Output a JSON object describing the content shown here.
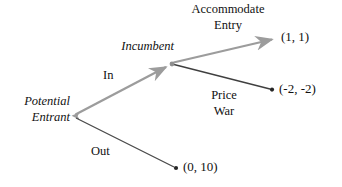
{
  "diagram": {
    "type": "extensive-form-game-tree",
    "colors": {
      "gray_path": "#9c9c9c",
      "dark_path": "#4a4a4a",
      "text": "#111111",
      "background": "#ffffff"
    },
    "nodes": [
      {
        "id": "potential-entrant",
        "label_line1": "Potential",
        "label_line2": "Entrant",
        "style": "italic",
        "x": 72,
        "y": 116
      },
      {
        "id": "incumbent",
        "label_line1": "Incumbent",
        "style": "italic",
        "x": 172,
        "y": 64
      }
    ],
    "edges": [
      {
        "id": "edge-in",
        "label": "In",
        "from": "potential-entrant",
        "to": "incumbent",
        "color": "gray",
        "arrow": true
      },
      {
        "id": "edge-out",
        "label": "Out",
        "from": "potential-entrant",
        "to": "terminal-0-10",
        "color": "dark",
        "arrow": false
      },
      {
        "id": "edge-accommodate",
        "label_line1": "Accommodate",
        "label_line2": "Entry",
        "from": "incumbent",
        "to": "terminal-1-1",
        "color": "gray",
        "arrow": true
      },
      {
        "id": "edge-price-war",
        "label_line1": "Price",
        "label_line2": "War",
        "from": "incumbent",
        "to": "terminal-m2-m2",
        "color": "dark",
        "arrow": false
      }
    ],
    "terminals": [
      {
        "id": "terminal-1-1",
        "payoff": "(1, 1)",
        "x": 278,
        "y": 38
      },
      {
        "id": "terminal-m2-m2",
        "payoff": "(-2, -2)",
        "x": 272,
        "y": 90
      },
      {
        "id": "terminal-0-10",
        "payoff": "(0, 10)",
        "x": 176,
        "y": 168
      }
    ]
  }
}
